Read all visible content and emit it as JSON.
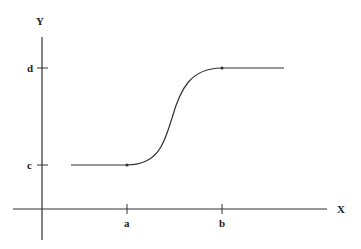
{
  "diagram": {
    "axes": {
      "x_label": "X",
      "y_label": "Y"
    },
    "x_ticks": [
      {
        "label": "a"
      },
      {
        "label": "b"
      }
    ],
    "y_ticks": [
      {
        "label": "c"
      },
      {
        "label": "d"
      }
    ],
    "curve": {
      "description": "Flat line at level c, sigmoid rise from x=a to x=b, flat line at level d",
      "color": "#333333",
      "points": [
        "start plateau at c",
        "dot at (a, c)",
        "S-curve",
        "dot at (b, d)",
        "end plateau at d"
      ]
    }
  }
}
